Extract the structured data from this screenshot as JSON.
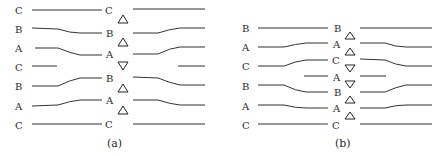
{
  "panels": [
    {
      "id": "a",
      "caption": "(a)",
      "left_labels": [
        "C",
        "B",
        "A",
        "C",
        "B",
        "A",
        "C"
      ],
      "center_labels": [
        "C",
        "B",
        "A",
        "B",
        "A",
        "C"
      ],
      "triangles": [
        "up",
        "up",
        "down",
        "up",
        "up"
      ]
    },
    {
      "id": "b",
      "caption": "(b)",
      "left_labels": [
        "B",
        "A",
        "C",
        "B",
        "A",
        "C"
      ],
      "center_labels": [
        "B",
        "A",
        "C",
        "A",
        "B",
        "A",
        "C"
      ],
      "triangles": [
        "up",
        "up",
        "down",
        "down",
        "up",
        "up"
      ]
    }
  ]
}
